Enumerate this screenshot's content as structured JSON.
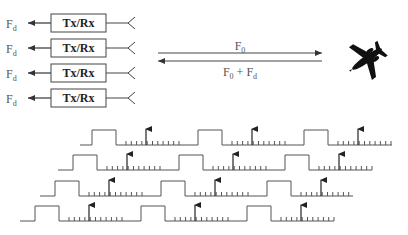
{
  "channels": [
    {
      "output_label": "F",
      "output_sub": "d",
      "box_label": "Tx/Rx"
    },
    {
      "output_label": "F",
      "output_sub": "d",
      "box_label": "Tx/Rx"
    },
    {
      "output_label": "F",
      "output_sub": "d",
      "box_label": "Tx/Rx"
    },
    {
      "output_label": "F",
      "output_sub": "d",
      "box_label": "Tx/Rx"
    }
  ],
  "signal_path": {
    "transmit_label": "F",
    "transmit_sub": "0",
    "return_label_a": "F",
    "return_sub_a": "0",
    "return_plus": " + ",
    "return_label_b": "F",
    "return_sub_b": "d"
  },
  "target": {
    "icon": "airplane-icon"
  },
  "waveforms": {
    "rows": 4,
    "description": "Staggered pulse trains with range-gate ticks and echo arrows"
  },
  "colors": {
    "line": "#444444",
    "aircraft": "#111111",
    "text": "#555555"
  }
}
